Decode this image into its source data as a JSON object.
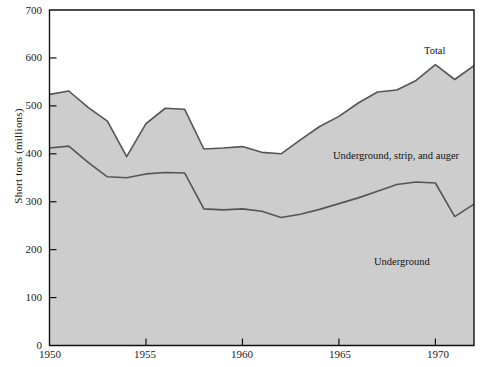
{
  "chart_data": {
    "type": "area",
    "title": "",
    "xlabel": "",
    "ylabel": "Short tons (millions)",
    "xlim": [
      1950,
      1972
    ],
    "ylim": [
      0,
      700
    ],
    "grid": false,
    "stacked": true,
    "legend_position": "inline-annotations",
    "x": [
      1950,
      1951,
      1952,
      1953,
      1954,
      1955,
      1956,
      1957,
      1958,
      1959,
      1960,
      1961,
      1962,
      1963,
      1964,
      1965,
      1966,
      1967,
      1968,
      1969,
      1970,
      1971,
      1972
    ],
    "series": [
      {
        "name": "Underground",
        "values": [
          412,
          416,
          382,
          352,
          350,
          358,
          361,
          360,
          285,
          283,
          285,
          280,
          267,
          274,
          284,
          296,
          308,
          322,
          336,
          341,
          339,
          269,
          295
        ]
      },
      {
        "name": "Underground, strip, and auger",
        "values": [
          524,
          531,
          497,
          468,
          394,
          463,
          495,
          493,
          410,
          412,
          415,
          403,
          400,
          429,
          457,
          478,
          506,
          529,
          533,
          553,
          586,
          555,
          584
        ],
        "note": "Total of all mining methods (upper boundary of stacked area)"
      }
    ],
    "annotations": [
      {
        "text": "Total",
        "x": 1970.0,
        "y": 615
      },
      {
        "text": "Underground, strip, and auger",
        "x": 1964.5,
        "y": 395
      },
      {
        "text": "Underground",
        "x": 1966.8,
        "y": 172
      }
    ],
    "xticks": [
      1950,
      1955,
      1960,
      1965,
      1970
    ],
    "xtick_labels": [
      "1950",
      "1955",
      "1960",
      "1965",
      "1970"
    ],
    "yticks": [
      0,
      100,
      200,
      300,
      400,
      500,
      600,
      700
    ],
    "ytick_labels": [
      "0",
      "100",
      "200",
      "300",
      "400",
      "500",
      "600",
      "700"
    ],
    "colors": {
      "area_fill": "#cdcdcd",
      "line": "#555555",
      "axis": "#111111",
      "text": "#1b1b1b",
      "background": "#ffffff"
    }
  }
}
